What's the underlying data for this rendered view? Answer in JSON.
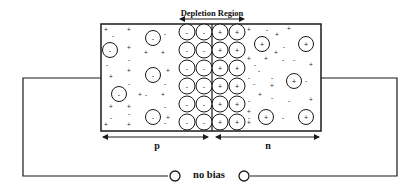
{
  "diagram": {
    "title_label": "Depletion Region",
    "p_label": "p",
    "n_label": "n",
    "bias_label": "no bias",
    "colors": {
      "stroke": "#1a1a1a",
      "background": "#ffffff"
    },
    "depletion_columns": [
      {
        "x": 187,
        "charge": "-"
      },
      {
        "x": 204,
        "charge": "-"
      },
      {
        "x": 220,
        "charge": "+"
      },
      {
        "x": 237,
        "charge": "+"
      }
    ],
    "depletion_rows_y": [
      32,
      50,
      68,
      86,
      104,
      122
    ],
    "p_region_ions": [
      {
        "x": 153,
        "y": 38,
        "charge": "-"
      },
      {
        "x": 110,
        "y": 50,
        "charge": "-"
      },
      {
        "x": 153,
        "y": 75,
        "charge": "-"
      },
      {
        "x": 119,
        "y": 94,
        "charge": "-"
      },
      {
        "x": 153,
        "y": 117,
        "charge": "-"
      }
    ],
    "n_region_ions": [
      {
        "x": 262,
        "y": 44,
        "charge": "+"
      },
      {
        "x": 306,
        "y": 44,
        "charge": "+"
      },
      {
        "x": 294,
        "y": 81,
        "charge": "+"
      },
      {
        "x": 266,
        "y": 117,
        "charge": "+"
      },
      {
        "x": 306,
        "y": 117,
        "charge": "+"
      }
    ],
    "p_carriers": [
      {
        "x": 106,
        "y": 30,
        "s": "+"
      },
      {
        "x": 113,
        "y": 36,
        "s": "-"
      },
      {
        "x": 129,
        "y": 30,
        "s": "+"
      },
      {
        "x": 165,
        "y": 34,
        "s": "-"
      },
      {
        "x": 129,
        "y": 48,
        "s": "+"
      },
      {
        "x": 146,
        "y": 53,
        "s": "+"
      },
      {
        "x": 163,
        "y": 53,
        "s": "+"
      },
      {
        "x": 129,
        "y": 60,
        "s": "-"
      },
      {
        "x": 107,
        "y": 65,
        "s": "-"
      },
      {
        "x": 111,
        "y": 77,
        "s": "+"
      },
      {
        "x": 129,
        "y": 71,
        "s": "+"
      },
      {
        "x": 168,
        "y": 71,
        "s": "+"
      },
      {
        "x": 129,
        "y": 84,
        "s": "-"
      },
      {
        "x": 165,
        "y": 84,
        "s": "-"
      },
      {
        "x": 140,
        "y": 95,
        "s": "+"
      },
      {
        "x": 146,
        "y": 95,
        "s": "-"
      },
      {
        "x": 163,
        "y": 95,
        "s": "+"
      },
      {
        "x": 111,
        "y": 107,
        "s": "+"
      },
      {
        "x": 129,
        "y": 107,
        "s": "+"
      },
      {
        "x": 129,
        "y": 114,
        "s": "-"
      },
      {
        "x": 111,
        "y": 118,
        "s": "-"
      },
      {
        "x": 106,
        "y": 125,
        "s": "+"
      },
      {
        "x": 129,
        "y": 125,
        "s": "+"
      },
      {
        "x": 168,
        "y": 118,
        "s": "+"
      },
      {
        "x": 165,
        "y": 107,
        "s": "-"
      },
      {
        "x": 165,
        "y": 123,
        "s": "-"
      }
    ],
    "n_carriers": [
      {
        "x": 249,
        "y": 30,
        "s": "+"
      },
      {
        "x": 267,
        "y": 30,
        "s": "-"
      },
      {
        "x": 277,
        "y": 35,
        "s": "+"
      },
      {
        "x": 289,
        "y": 29,
        "s": "+"
      },
      {
        "x": 284,
        "y": 47,
        "s": "-"
      },
      {
        "x": 276,
        "y": 53,
        "s": "+"
      },
      {
        "x": 249,
        "y": 59,
        "s": "+"
      },
      {
        "x": 266,
        "y": 59,
        "s": "+"
      },
      {
        "x": 283,
        "y": 60,
        "s": "-"
      },
      {
        "x": 294,
        "y": 60,
        "s": "-"
      },
      {
        "x": 311,
        "y": 65,
        "s": "+"
      },
      {
        "x": 255,
        "y": 65,
        "s": "-"
      },
      {
        "x": 259,
        "y": 71,
        "s": "-"
      },
      {
        "x": 272,
        "y": 78,
        "s": "-"
      },
      {
        "x": 249,
        "y": 78,
        "s": "-"
      },
      {
        "x": 272,
        "y": 86,
        "s": "+"
      },
      {
        "x": 254,
        "y": 84,
        "s": "-"
      },
      {
        "x": 306,
        "y": 81,
        "s": "-"
      },
      {
        "x": 260,
        "y": 95,
        "s": "+"
      },
      {
        "x": 272,
        "y": 98,
        "s": "-"
      },
      {
        "x": 249,
        "y": 101,
        "s": "-"
      },
      {
        "x": 289,
        "y": 101,
        "s": "-"
      },
      {
        "x": 311,
        "y": 100,
        "s": "+"
      },
      {
        "x": 249,
        "y": 112,
        "s": "+"
      },
      {
        "x": 249,
        "y": 123,
        "s": "+"
      },
      {
        "x": 283,
        "y": 118,
        "s": "-"
      },
      {
        "x": 249,
        "y": 118,
        "s": "-"
      }
    ]
  }
}
